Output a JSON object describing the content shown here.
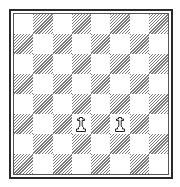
{
  "board": {
    "orientation": "white-bottom",
    "files": [
      "a",
      "b",
      "c",
      "d",
      "e",
      "f",
      "g",
      "h"
    ],
    "ranks": [
      "8",
      "7",
      "6",
      "5",
      "4",
      "3",
      "2",
      "1"
    ],
    "top_left_square_color": "light",
    "colors": {
      "light_square": "#ffffff",
      "dark_square_hatch": "#7a7a7a",
      "frame": "#2a2a2a"
    },
    "pieces": [
      {
        "square": "d3",
        "color": "white",
        "type": "pawn",
        "icon": "white-pawn-icon"
      },
      {
        "square": "f3",
        "color": "white",
        "type": "pawn",
        "icon": "white-pawn-icon"
      }
    ]
  }
}
